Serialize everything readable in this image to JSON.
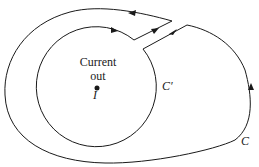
{
  "diagram": {
    "labels": {
      "current": "Current",
      "out": "out",
      "source": "I",
      "inner_curve": "C′",
      "outer_curve": "C"
    },
    "colors": {
      "stroke": "#1a1a1a",
      "background": "#ffffff"
    }
  }
}
